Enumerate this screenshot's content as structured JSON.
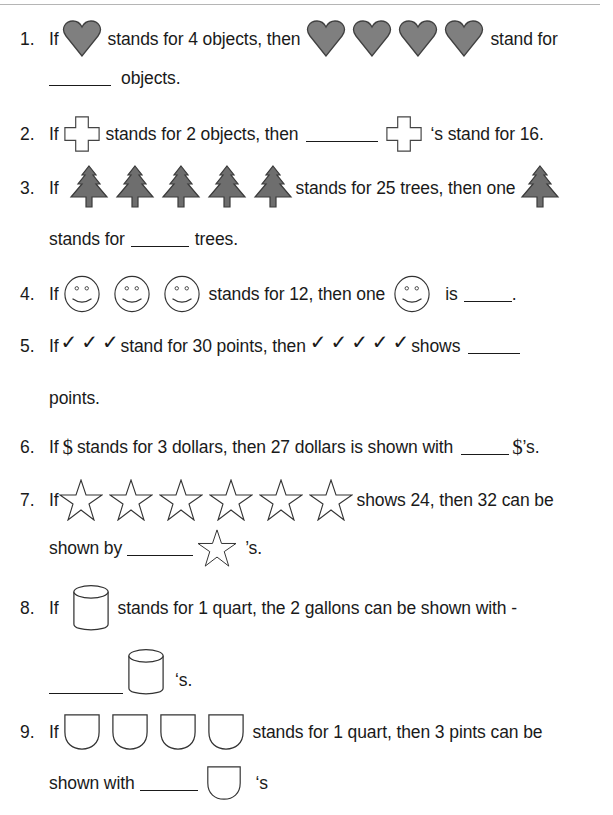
{
  "colors": {
    "text": "#1a1a1a",
    "icon_fill": "#7f7f7f",
    "icon_stroke": "#404040",
    "outline": "#333333"
  },
  "questions": [
    {
      "number": "1.",
      "parts": [
        "If",
        "stands for 4 objects, then",
        "stand for",
        "objects."
      ],
      "icon": "heart-icon",
      "icon_count_given": 1,
      "icon_count_asked": 4
    },
    {
      "number": "2.",
      "parts": [
        "If",
        "stands for 2 objects, then",
        "‘s stand for 16."
      ],
      "icon": "plus-outline-icon"
    },
    {
      "number": "3.",
      "parts": [
        "If",
        "stands for 25 trees, then one",
        "stands for",
        "trees."
      ],
      "icon": "tree-icon",
      "icon_count_given": 5
    },
    {
      "number": "4.",
      "parts": [
        "If",
        "stands for 12, then one",
        "is",
        "."
      ],
      "icon": "smiley-icon",
      "icon_count_given": 3
    },
    {
      "number": "5.",
      "parts": [
        "If",
        "stand for 30 points, then",
        "shows",
        "points."
      ],
      "icon": "checkmark-icon",
      "icon_glyph": "✓",
      "icon_count_given": 3,
      "icon_count_asked": 5
    },
    {
      "number": "6.",
      "parts": [
        "If",
        "stands for 3 dollars, then 27 dollars is shown with",
        "’s."
      ],
      "icon": "dollar-icon",
      "icon_glyph": "$"
    },
    {
      "number": "7.",
      "parts": [
        "If",
        "shows 24, then 32 can be",
        "shown by",
        "’s."
      ],
      "icon": "star-outline-icon",
      "icon_count_given": 6
    },
    {
      "number": "8.",
      "parts": [
        "If",
        "stands for 1 quart, the 2 gallons can be shown with -",
        "‘s."
      ],
      "icon": "cylinder-icon"
    },
    {
      "number": "9.",
      "parts": [
        "If",
        "stands for 1 quart, then 3 pints can be",
        "shown with",
        "‘s"
      ],
      "icon": "cup-icon",
      "icon_count_given": 4
    }
  ]
}
